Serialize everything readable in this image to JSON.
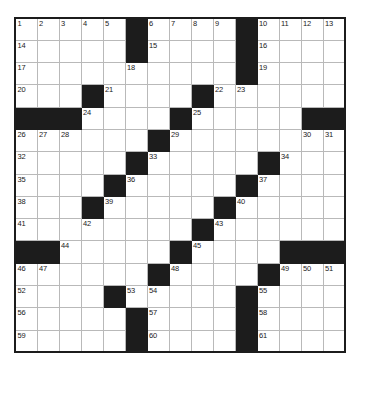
{
  "puzzle": {
    "title": "Crossword Grid",
    "type": "crossword-grid",
    "rows": 15,
    "columns": 15,
    "cell_size_px": 22,
    "colors": {
      "block": "#1c1c1c",
      "cell": "#ffffff",
      "cell_border": "#b9b9b9",
      "outer_border": "#1c1c1c",
      "number_text": "#1a1a1a"
    },
    "max_clue_number": 61,
    "grid": [
      [
        {
          "block": false,
          "num": "1"
        },
        {
          "block": false,
          "num": "2"
        },
        {
          "block": false,
          "num": "3"
        },
        {
          "block": false,
          "num": "4"
        },
        {
          "block": false,
          "num": "5"
        },
        {
          "block": true,
          "num": ""
        },
        {
          "block": false,
          "num": "6"
        },
        {
          "block": false,
          "num": "7"
        },
        {
          "block": false,
          "num": "8"
        },
        {
          "block": false,
          "num": "9"
        },
        {
          "block": true,
          "num": ""
        },
        {
          "block": false,
          "num": "10"
        },
        {
          "block": false,
          "num": "11"
        },
        {
          "block": false,
          "num": "12"
        },
        {
          "block": false,
          "num": "13"
        }
      ],
      [
        {
          "block": false,
          "num": "14"
        },
        {
          "block": false,
          "num": ""
        },
        {
          "block": false,
          "num": ""
        },
        {
          "block": false,
          "num": ""
        },
        {
          "block": false,
          "num": ""
        },
        {
          "block": true,
          "num": ""
        },
        {
          "block": false,
          "num": "15"
        },
        {
          "block": false,
          "num": ""
        },
        {
          "block": false,
          "num": ""
        },
        {
          "block": false,
          "num": ""
        },
        {
          "block": true,
          "num": ""
        },
        {
          "block": false,
          "num": "16"
        },
        {
          "block": false,
          "num": ""
        },
        {
          "block": false,
          "num": ""
        },
        {
          "block": false,
          "num": ""
        }
      ],
      [
        {
          "block": false,
          "num": "17"
        },
        {
          "block": false,
          "num": ""
        },
        {
          "block": false,
          "num": ""
        },
        {
          "block": false,
          "num": ""
        },
        {
          "block": false,
          "num": ""
        },
        {
          "block": false,
          "num": "18"
        },
        {
          "block": false,
          "num": ""
        },
        {
          "block": false,
          "num": ""
        },
        {
          "block": false,
          "num": ""
        },
        {
          "block": false,
          "num": ""
        },
        {
          "block": true,
          "num": ""
        },
        {
          "block": false,
          "num": "19"
        },
        {
          "block": false,
          "num": ""
        },
        {
          "block": false,
          "num": ""
        },
        {
          "block": false,
          "num": ""
        }
      ],
      [
        {
          "block": false,
          "num": "20"
        },
        {
          "block": false,
          "num": ""
        },
        {
          "block": false,
          "num": ""
        },
        {
          "block": true,
          "num": ""
        },
        {
          "block": false,
          "num": "21"
        },
        {
          "block": false,
          "num": ""
        },
        {
          "block": false,
          "num": ""
        },
        {
          "block": false,
          "num": ""
        },
        {
          "block": true,
          "num": ""
        },
        {
          "block": false,
          "num": "22"
        },
        {
          "block": false,
          "num": "23"
        },
        {
          "block": false,
          "num": ""
        },
        {
          "block": false,
          "num": ""
        },
        {
          "block": false,
          "num": ""
        },
        {
          "block": false,
          "num": ""
        }
      ],
      [
        {
          "block": true,
          "num": ""
        },
        {
          "block": true,
          "num": ""
        },
        {
          "block": true,
          "num": ""
        },
        {
          "block": false,
          "num": "24"
        },
        {
          "block": false,
          "num": ""
        },
        {
          "block": false,
          "num": ""
        },
        {
          "block": false,
          "num": ""
        },
        {
          "block": true,
          "num": ""
        },
        {
          "block": false,
          "num": "25"
        },
        {
          "block": false,
          "num": ""
        },
        {
          "block": false,
          "num": ""
        },
        {
          "block": false,
          "num": ""
        },
        {
          "block": false,
          "num": ""
        },
        {
          "block": true,
          "num": ""
        },
        {
          "block": true,
          "num": ""
        }
      ],
      [
        {
          "block": false,
          "num": "26"
        },
        {
          "block": false,
          "num": "27"
        },
        {
          "block": false,
          "num": "28"
        },
        {
          "block": false,
          "num": ""
        },
        {
          "block": false,
          "num": ""
        },
        {
          "block": false,
          "num": ""
        },
        {
          "block": true,
          "num": ""
        },
        {
          "block": false,
          "num": "29"
        },
        {
          "block": false,
          "num": ""
        },
        {
          "block": false,
          "num": ""
        },
        {
          "block": false,
          "num": ""
        },
        {
          "block": false,
          "num": ""
        },
        {
          "block": false,
          "num": ""
        },
        {
          "block": false,
          "num": "30"
        },
        {
          "block": false,
          "num": "31"
        }
      ],
      [
        {
          "block": false,
          "num": "32"
        },
        {
          "block": false,
          "num": ""
        },
        {
          "block": false,
          "num": ""
        },
        {
          "block": false,
          "num": ""
        },
        {
          "block": false,
          "num": ""
        },
        {
          "block": true,
          "num": ""
        },
        {
          "block": false,
          "num": "33"
        },
        {
          "block": false,
          "num": ""
        },
        {
          "block": false,
          "num": ""
        },
        {
          "block": false,
          "num": ""
        },
        {
          "block": false,
          "num": ""
        },
        {
          "block": true,
          "num": ""
        },
        {
          "block": false,
          "num": "34"
        },
        {
          "block": false,
          "num": ""
        },
        {
          "block": false,
          "num": ""
        }
      ],
      [
        {
          "block": false,
          "num": "35"
        },
        {
          "block": false,
          "num": ""
        },
        {
          "block": false,
          "num": ""
        },
        {
          "block": false,
          "num": ""
        },
        {
          "block": true,
          "num": ""
        },
        {
          "block": false,
          "num": "36"
        },
        {
          "block": false,
          "num": ""
        },
        {
          "block": false,
          "num": ""
        },
        {
          "block": false,
          "num": ""
        },
        {
          "block": false,
          "num": ""
        },
        {
          "block": true,
          "num": ""
        },
        {
          "block": false,
          "num": "37"
        },
        {
          "block": false,
          "num": ""
        },
        {
          "block": false,
          "num": ""
        },
        {
          "block": false,
          "num": ""
        }
      ],
      [
        {
          "block": false,
          "num": "38"
        },
        {
          "block": false,
          "num": ""
        },
        {
          "block": false,
          "num": ""
        },
        {
          "block": true,
          "num": ""
        },
        {
          "block": false,
          "num": "39"
        },
        {
          "block": false,
          "num": ""
        },
        {
          "block": false,
          "num": ""
        },
        {
          "block": false,
          "num": ""
        },
        {
          "block": false,
          "num": ""
        },
        {
          "block": true,
          "num": ""
        },
        {
          "block": false,
          "num": "40"
        },
        {
          "block": false,
          "num": ""
        },
        {
          "block": false,
          "num": ""
        },
        {
          "block": false,
          "num": ""
        },
        {
          "block": false,
          "num": ""
        }
      ],
      [
        {
          "block": false,
          "num": "41"
        },
        {
          "block": false,
          "num": ""
        },
        {
          "block": false,
          "num": ""
        },
        {
          "block": false,
          "num": "42"
        },
        {
          "block": false,
          "num": ""
        },
        {
          "block": false,
          "num": ""
        },
        {
          "block": false,
          "num": ""
        },
        {
          "block": false,
          "num": ""
        },
        {
          "block": true,
          "num": ""
        },
        {
          "block": false,
          "num": "43"
        },
        {
          "block": false,
          "num": ""
        },
        {
          "block": false,
          "num": ""
        },
        {
          "block": false,
          "num": ""
        },
        {
          "block": false,
          "num": ""
        },
        {
          "block": false,
          "num": ""
        }
      ],
      [
        {
          "block": true,
          "num": ""
        },
        {
          "block": true,
          "num": ""
        },
        {
          "block": false,
          "num": "44"
        },
        {
          "block": false,
          "num": ""
        },
        {
          "block": false,
          "num": ""
        },
        {
          "block": false,
          "num": ""
        },
        {
          "block": false,
          "num": ""
        },
        {
          "block": true,
          "num": ""
        },
        {
          "block": false,
          "num": "45"
        },
        {
          "block": false,
          "num": ""
        },
        {
          "block": false,
          "num": ""
        },
        {
          "block": false,
          "num": ""
        },
        {
          "block": true,
          "num": ""
        },
        {
          "block": true,
          "num": ""
        },
        {
          "block": true,
          "num": ""
        }
      ],
      [
        {
          "block": false,
          "num": "46"
        },
        {
          "block": false,
          "num": "47"
        },
        {
          "block": false,
          "num": ""
        },
        {
          "block": false,
          "num": ""
        },
        {
          "block": false,
          "num": ""
        },
        {
          "block": false,
          "num": ""
        },
        {
          "block": true,
          "num": ""
        },
        {
          "block": false,
          "num": "48"
        },
        {
          "block": false,
          "num": ""
        },
        {
          "block": false,
          "num": ""
        },
        {
          "block": false,
          "num": ""
        },
        {
          "block": true,
          "num": ""
        },
        {
          "block": false,
          "num": "49"
        },
        {
          "block": false,
          "num": "50"
        },
        {
          "block": false,
          "num": "51"
        }
      ],
      [
        {
          "block": false,
          "num": "52"
        },
        {
          "block": false,
          "num": ""
        },
        {
          "block": false,
          "num": ""
        },
        {
          "block": false,
          "num": ""
        },
        {
          "block": true,
          "num": ""
        },
        {
          "block": false,
          "num": "53"
        },
        {
          "block": false,
          "num": "54"
        },
        {
          "block": false,
          "num": ""
        },
        {
          "block": false,
          "num": ""
        },
        {
          "block": false,
          "num": ""
        },
        {
          "block": true,
          "num": ""
        },
        {
          "block": false,
          "num": "55"
        },
        {
          "block": false,
          "num": ""
        },
        {
          "block": false,
          "num": ""
        },
        {
          "block": false,
          "num": ""
        }
      ],
      [
        {
          "block": false,
          "num": "56"
        },
        {
          "block": false,
          "num": ""
        },
        {
          "block": false,
          "num": ""
        },
        {
          "block": false,
          "num": ""
        },
        {
          "block": false,
          "num": ""
        },
        {
          "block": true,
          "num": ""
        },
        {
          "block": false,
          "num": "57"
        },
        {
          "block": false,
          "num": ""
        },
        {
          "block": false,
          "num": ""
        },
        {
          "block": false,
          "num": ""
        },
        {
          "block": true,
          "num": ""
        },
        {
          "block": false,
          "num": "58"
        },
        {
          "block": false,
          "num": ""
        },
        {
          "block": false,
          "num": ""
        },
        {
          "block": false,
          "num": ""
        }
      ],
      [
        {
          "block": false,
          "num": "59"
        },
        {
          "block": false,
          "num": ""
        },
        {
          "block": false,
          "num": ""
        },
        {
          "block": false,
          "num": ""
        },
        {
          "block": false,
          "num": ""
        },
        {
          "block": true,
          "num": ""
        },
        {
          "block": false,
          "num": "60"
        },
        {
          "block": false,
          "num": ""
        },
        {
          "block": false,
          "num": ""
        },
        {
          "block": false,
          "num": ""
        },
        {
          "block": true,
          "num": ""
        },
        {
          "block": false,
          "num": "61"
        },
        {
          "block": false,
          "num": ""
        },
        {
          "block": false,
          "num": ""
        },
        {
          "block": false,
          "num": ""
        }
      ]
    ]
  }
}
